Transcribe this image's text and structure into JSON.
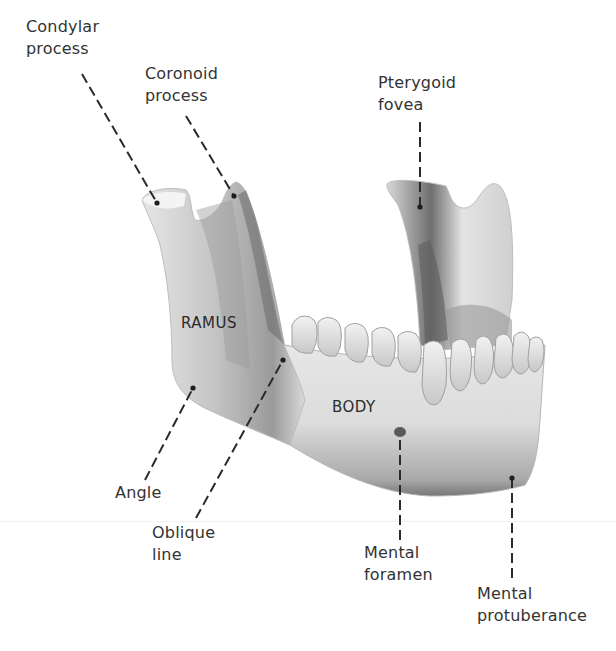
{
  "figure": {
    "labels": {
      "condylar_process": {
        "line1": "Condylar",
        "line2": "process"
      },
      "coronoid_process": {
        "line1": "Coronoid",
        "line2": "process"
      },
      "pterygoid_fovea": {
        "line1": "Pterygoid",
        "line2": "fovea"
      },
      "angle": {
        "line1": "Angle"
      },
      "oblique_line": {
        "line1": "Oblique",
        "line2": "line"
      },
      "mental_foramen": {
        "line1": "Mental",
        "line2": "foramen"
      },
      "mental_protuberance": {
        "line1": "Mental",
        "line2": "protuberance"
      }
    },
    "regions": {
      "ramus": "RAMUS",
      "body": "BODY"
    },
    "colors": {
      "bone_light": "#efefef",
      "bone_mid": "#c9c9c9",
      "bone_shadow": "#7a7a7a",
      "leader_line": "#2a2a2a",
      "text": "#333333"
    }
  }
}
